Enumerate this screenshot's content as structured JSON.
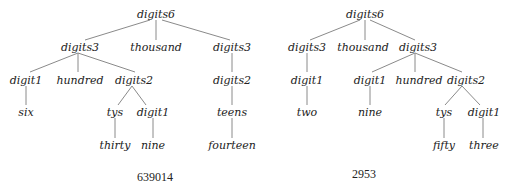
{
  "trees": [
    {
      "caption": "639014",
      "nodes": {
        "root": "digits6",
        "l1_left": "digits3",
        "l1_mid": "thousand",
        "l1_right": "digits3",
        "l2_digit1": "digit1",
        "l2_hundred": "hundred",
        "l2_digits2": "digits2",
        "l2_right_digits2": "digits2",
        "l3_six": "six",
        "l3_tys": "tys",
        "l3_digit1": "digit1",
        "l3_teens": "teens",
        "l4_thirty": "thirty",
        "l4_nine": "nine",
        "l4_fourteen": "fourteen"
      }
    },
    {
      "caption": "2953",
      "nodes": {
        "root": "digits6",
        "l1_left": "digits3",
        "l1_mid": "thousand",
        "l1_right": "digits3",
        "l2_left_digit1": "digit1",
        "l2_digit1": "digit1",
        "l2_hundred": "hundred",
        "l2_digits2": "digits2",
        "l3_two": "two",
        "l3_nine": "nine",
        "l3_tys": "tys",
        "l3_digit1": "digit1",
        "l4_fifty": "fifty",
        "l4_three": "three"
      }
    }
  ]
}
